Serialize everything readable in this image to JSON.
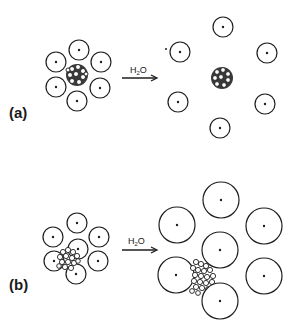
{
  "figure": {
    "panels": [
      {
        "label": "(a)",
        "reagent": "H2O",
        "reagent_main": "H",
        "reagent_sub": "2",
        "reagent_tail": "O",
        "description": "Small particles around aggregate disperse into water; aggregate remains separate"
      },
      {
        "label": "(b)",
        "reagent": "H2O",
        "reagent_main": "H",
        "reagent_sub": "2",
        "reagent_tail": "O",
        "description": "Particles swell in water; aggregate remains attached between swollen particles"
      }
    ],
    "colors": {
      "stroke": "#1e1e1e",
      "background": "#ffffff"
    }
  }
}
